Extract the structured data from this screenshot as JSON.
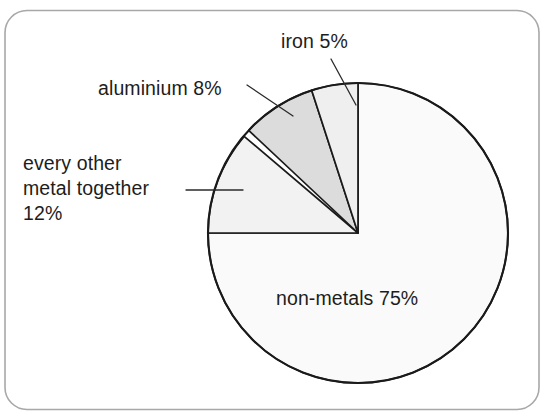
{
  "figure": {
    "background_color": "#ffffff",
    "frame_color": "#a8a8a8",
    "outline_color": "#1a1a1a"
  },
  "chart_data": {
    "type": "pie",
    "title": "",
    "subtitle": "",
    "xlabel": "",
    "ylabel": "",
    "grid": false,
    "legend_position": "none",
    "label_style": "callout-with-leader-lines",
    "units": "percent",
    "total": 100,
    "start_angle_deg": 0,
    "direction": "counterclockwise",
    "center": {
      "x": 358,
      "y": 233
    },
    "radius": 150,
    "categories": [
      "iron",
      "aluminium",
      "every other metal together",
      "non-metals"
    ],
    "values": [
      5,
      8,
      12,
      75
    ],
    "slices": [
      {
        "name": "iron",
        "label": "iron 5%",
        "label_lines": [
          "iron 5%"
        ],
        "value": 5,
        "value_text": "5%",
        "fill": "#efefef",
        "label_placement": "outside",
        "has_leader_line": true
      },
      {
        "name": "aluminium",
        "label": "aluminium 8%",
        "label_lines": [
          "aluminium 8%"
        ],
        "value": 8,
        "value_text": "8%",
        "fill": "#dcdcdc",
        "label_placement": "outside",
        "has_leader_line": true
      },
      {
        "name": "every other metal together",
        "label": "every other metal together 12%",
        "label_lines": [
          "every other",
          "metal together",
          "12%"
        ],
        "value": 12,
        "value_text": "12%",
        "fill": "#f2f2f2",
        "label_placement": "outside",
        "has_leader_line": true
      },
      {
        "name": "non-metals",
        "label": "non-metals 75%",
        "label_lines": [
          "non-metals 75%"
        ],
        "value": 75,
        "value_text": "75%",
        "fill": "#fafafa",
        "label_placement": "inside",
        "has_leader_line": false
      }
    ]
  },
  "labels": {
    "iron": "iron 5%",
    "aluminium": "aluminium 8%",
    "other_metal_line1": "every other",
    "other_metal_line2": "metal together",
    "other_metal_line3": "12%",
    "non_metals": "non-metals 75%"
  }
}
